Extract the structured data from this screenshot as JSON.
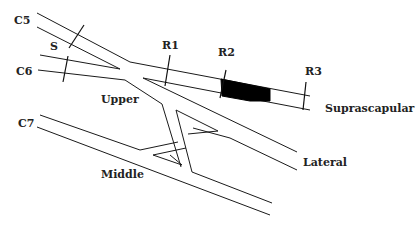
{
  "diagram": {
    "roots": [
      {
        "id": "c5",
        "label": "C5"
      },
      {
        "id": "c6",
        "label": "C6"
      },
      {
        "id": "c7",
        "label": "C7"
      }
    ],
    "trunks": [
      {
        "id": "upper",
        "label": "Upper"
      },
      {
        "id": "middle",
        "label": "Middle"
      }
    ],
    "branches": [
      {
        "id": "suprascapular",
        "label": "Suprascapular"
      },
      {
        "id": "lateral",
        "label": "Lateral"
      }
    ],
    "markers": [
      {
        "id": "s",
        "label": "S"
      },
      {
        "id": "r1",
        "label": "R1"
      },
      {
        "id": "r2",
        "label": "R2"
      },
      {
        "id": "r3",
        "label": "R3"
      }
    ],
    "colors": {
      "line": "#1a1a1a",
      "lesion": "#000000",
      "background": "#ffffff"
    }
  }
}
